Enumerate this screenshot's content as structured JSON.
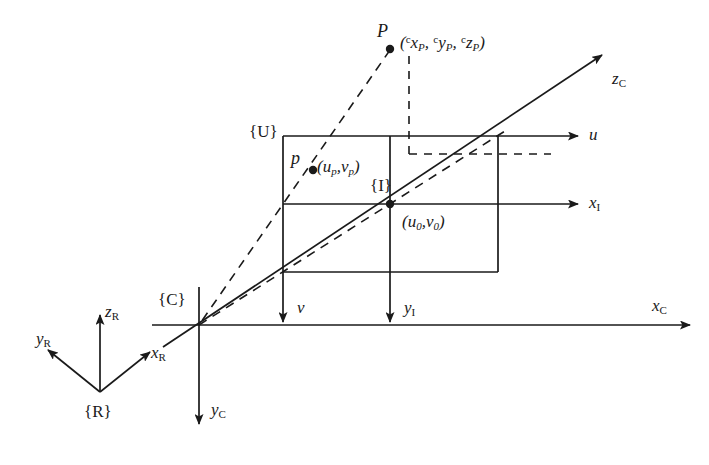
{
  "figure": {
    "background_color": "#ffffff",
    "line_color": "#1a1a1a"
  },
  "frames": {
    "reference": {
      "label": "{R}",
      "name": "reference-frame"
    },
    "camera": {
      "label": "{C}",
      "name": "camera-frame"
    },
    "pixel": {
      "label": "{U}",
      "name": "pixel-frame"
    },
    "image": {
      "label": "{I}",
      "name": "image-frame"
    }
  },
  "points": {
    "world_point": {
      "label": "P",
      "coords_text": "( x , y , z )",
      "coord_parts": {
        "open": "(",
        "sup1": "c",
        "var1": "x",
        "sub1": "P",
        "sep1": ", ",
        "sup2": "c",
        "var2": "y",
        "sub2": "P",
        "sep2": ", ",
        "sup3": "c",
        "var3": "z",
        "sub3": "P",
        "close": ")"
      }
    },
    "image_point": {
      "label": "p",
      "coord_parts": {
        "open": "(",
        "var1": "u",
        "sub1": "p",
        "sep1": ",",
        "var2": "v",
        "sub2": "p",
        "close": ")"
      }
    },
    "principal_point": {
      "coord_parts": {
        "open": "(",
        "var1": "u",
        "sub1": "0",
        "sep1": ",",
        "var2": "v",
        "sub2": "0",
        "close": ")"
      }
    }
  },
  "axes": {
    "reference": [
      {
        "name": "axis-z-r",
        "var": "z",
        "sub": "R"
      },
      {
        "name": "axis-y-r",
        "var": "y",
        "sub": "R"
      },
      {
        "name": "axis-x-r",
        "var": "x",
        "sub": "R"
      }
    ],
    "camera": [
      {
        "name": "axis-x-c",
        "var": "x",
        "sub": "C"
      },
      {
        "name": "axis-y-c",
        "var": "y",
        "sub": "C"
      },
      {
        "name": "axis-z-c",
        "var": "z",
        "sub": "C"
      }
    ],
    "pixel": [
      {
        "name": "axis-u",
        "var": "u",
        "sub": ""
      },
      {
        "name": "axis-v",
        "var": "v",
        "sub": ""
      }
    ],
    "image": [
      {
        "name": "axis-x-i",
        "var": "x",
        "sub": "I"
      },
      {
        "name": "axis-y-i",
        "var": "y",
        "sub": "I"
      }
    ]
  }
}
